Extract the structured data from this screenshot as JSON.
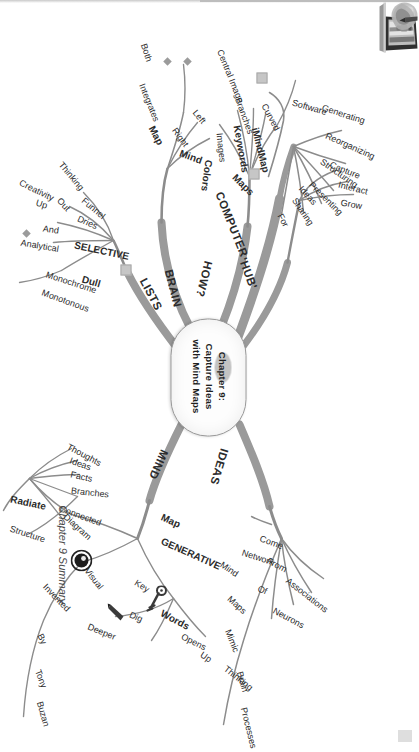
{
  "document": {
    "caption": "Chapter 9 Summary",
    "type": "mind-map"
  },
  "center": {
    "line1": "Chapter 9:",
    "line2": "Capture Ideas",
    "line3": "with Mind Maps"
  },
  "branches": [
    {
      "id": "computer",
      "label": "COMPUTER",
      "color": "#8c8c8c",
      "children": [
        {
          "label": "Maps"
        },
        {
          "label": "Generating"
        },
        {
          "label": "Reorganizing"
        },
        {
          "label": "Structuring"
        },
        {
          "label": "Presenting"
        },
        {
          "label": "Sharing"
        },
        {
          "label": "iMindMap"
        },
        {
          "label": "Software"
        }
      ]
    },
    {
      "id": "hub",
      "label": "'HUB'",
      "color": "#8c8c8c",
      "children": [
        {
          "label": "For"
        },
        {
          "label": "Ideas"
        },
        {
          "label": "Capture"
        },
        {
          "label": "Interact"
        },
        {
          "label": "Grow"
        }
      ]
    },
    {
      "id": "ideas",
      "label": "IDEAS",
      "color": "#8c8c8c",
      "children": [
        {
          "label": "Come"
        },
        {
          "label": "From"
        },
        {
          "label": "Associations"
        },
        {
          "label": "Network"
        },
        {
          "label": "Of"
        },
        {
          "label": "Neurons"
        },
        {
          "label": "Mind"
        },
        {
          "label": "Maps"
        },
        {
          "label": "Mimic"
        },
        {
          "label": "Brain"
        },
        {
          "label": "Processes"
        }
      ]
    },
    {
      "id": "mind",
      "label": "MIND",
      "color": "#8c8c8c",
      "children": [
        {
          "label": "Map"
        },
        {
          "label": "GENERATIVE"
        },
        {
          "label": "Key"
        },
        {
          "label": "Words"
        },
        {
          "label": "Opens"
        },
        {
          "label": "Up"
        },
        {
          "label": "Thinking"
        },
        {
          "label": "Dig"
        },
        {
          "label": "Deeper"
        },
        {
          "label": "Visual"
        },
        {
          "label": "Invented"
        },
        {
          "label": "By"
        },
        {
          "label": "Tony"
        },
        {
          "label": "Buzan"
        },
        {
          "label": "Diagram"
        },
        {
          "label": "Thoughts"
        },
        {
          "label": "Ideas"
        },
        {
          "label": "Facts"
        },
        {
          "label": "Branches"
        },
        {
          "label": "Connected"
        },
        {
          "label": "Radiate"
        },
        {
          "label": "Structure"
        }
      ]
    },
    {
      "id": "lists",
      "label": "LISTS",
      "color": "#8c8c8c",
      "children": [
        {
          "label": "Funnel"
        },
        {
          "label": "Thinking"
        },
        {
          "label": "Out"
        },
        {
          "label": "Dries"
        },
        {
          "label": "Up"
        },
        {
          "label": "Creativity"
        },
        {
          "label": "SELECTIVE"
        },
        {
          "label": "And"
        },
        {
          "label": "Analytical"
        },
        {
          "label": "Dull"
        },
        {
          "label": "Monochrome"
        },
        {
          "label": "Monotonous"
        }
      ]
    },
    {
      "id": "brain",
      "label": "BRAIN",
      "color": "#8c8c8c",
      "children": [
        {
          "label": "Mind"
        },
        {
          "label": "Map"
        },
        {
          "label": "Integrates"
        },
        {
          "label": "Both"
        },
        {
          "label": "Left"
        },
        {
          "label": "Right"
        }
      ]
    },
    {
      "id": "how",
      "label": "HOW?",
      "color": "#8c8c8c",
      "children": [
        {
          "label": "Central Image"
        },
        {
          "label": "Curved"
        },
        {
          "label": "Branches"
        },
        {
          "label": "Keywords"
        },
        {
          "label": "Images"
        },
        {
          "label": "Colors"
        }
      ]
    }
  ],
  "icons": {
    "laptop": "laptop-icon",
    "lightbulb": "lightbulb-icon",
    "key": "key-icon",
    "eye": "eye-icon",
    "color_splash": "color-splash-icon",
    "pencil": "pencil-icon"
  }
}
